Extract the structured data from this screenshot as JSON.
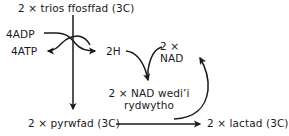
{
  "diagram": {
    "type": "anaerobic-respiration-lactate-fermentation",
    "language": "cy",
    "stroke_color": "#1a1a1a",
    "background_color": "#ffffff",
    "labels": {
      "title": "2 × trios ffosffad (3C)",
      "adp": "4ADP",
      "atp": "4ATP",
      "hydrogen": "2H",
      "nad": "2 × NAD",
      "reduced_nad": "2 × NAD wedi’i rydwytho",
      "pyruvate": "2 × pyrwfad (3C)",
      "lactate": "2 × lactad (3C)"
    },
    "arrows": [
      {
        "name": "main-vertical",
        "from": "title",
        "to": "pyruvate"
      },
      {
        "name": "adp-to-atp",
        "from": "adp",
        "to": "atp"
      },
      {
        "name": "to-hydrogen",
        "from": "title",
        "to": "hydrogen"
      },
      {
        "name": "hydrogen-to-reduced-nad",
        "from": "hydrogen",
        "to": "reduced_nad"
      },
      {
        "name": "nad-to-reduced-nad",
        "from": "nad",
        "to": "reduced_nad"
      },
      {
        "name": "pyruvate-to-lactate",
        "from": "pyruvate",
        "to": "lactate"
      },
      {
        "name": "reduced-nad-recycle",
        "from": "reduced_nad",
        "to": "nad"
      }
    ]
  }
}
